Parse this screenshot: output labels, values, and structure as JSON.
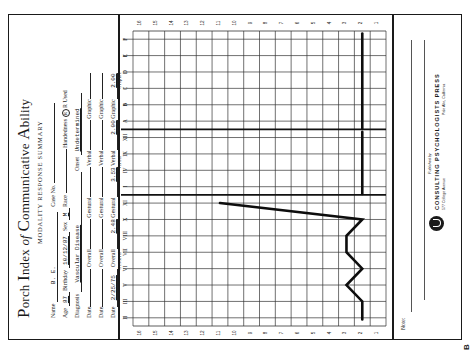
{
  "form": {
    "title_parts": [
      {
        "cap": "P",
        "rest": "orch "
      },
      {
        "cap": "I",
        "rest": "ndex "
      },
      {
        "cap": "",
        "rest": "of "
      },
      {
        "cap": "C",
        "rest": "ommunicative "
      },
      {
        "cap": "A",
        "rest": "bility"
      }
    ],
    "title": "Porch Index of Communicative Ability",
    "subtitle": "MODALITY RESPONSE SUMMARY",
    "fields": {
      "name_label": "Name",
      "name_value": "B. E.",
      "case_no_label": "Case No.",
      "case_no_value": "",
      "age_label": "Age",
      "age_value": "87",
      "birthday_label": "Birthday",
      "birthday_value": "10/12/87",
      "sex_label": "Sex",
      "sex_value": "M",
      "race_label": "Race",
      "race_value": "",
      "handedness_label": "Handedness",
      "handedness_value": "R",
      "hand_used_label": "R Used",
      "diagnosis_label": "Diagnosis",
      "diagnosis_value": "Vascular Disease",
      "onset_label": "Onset",
      "onset_value": "Undetermined"
    },
    "date_rows": [
      {
        "date_label": "Date",
        "date": "",
        "overall_label": "Overall",
        "overall": "",
        "gestural_label": "Gestural",
        "gestural": "",
        "verbal_label": "Verbal",
        "verbal": "",
        "graphic_label": "Graphic",
        "graphic": ""
      },
      {
        "date_label": "Date",
        "date": "",
        "overall_label": "Overall",
        "overall": "",
        "gestural_label": "Gestural",
        "gestural": "",
        "verbal_label": "Verbal",
        "verbal": "",
        "graphic_label": "Graphic",
        "graphic": ""
      },
      {
        "date_label": "Date",
        "date": "2/25/75",
        "overall_label": "Overall",
        "overall": "2.48",
        "gestural_label": "Gestural",
        "gestural": "3.53",
        "verbal_label": "Verbal",
        "verbal": "2.00",
        "graphic_label": "Graphic",
        "graphic": "2.00"
      }
    ]
  },
  "chart_data": {
    "type": "line",
    "title": "Modality Response Summary",
    "score_axis": {
      "label": "Score",
      "ticks": [
        16,
        15,
        14,
        13,
        12,
        11,
        10,
        9,
        8,
        7,
        6,
        5,
        4,
        3,
        2,
        1
      ],
      "range": [
        1,
        16
      ]
    },
    "sections": [
      {
        "name": "Gestural",
        "subtests": [
          "II",
          "III",
          "V",
          "VI",
          "VII",
          "VIII",
          "X",
          "XI"
        ]
      },
      {
        "name": "Verbal",
        "subtests": [
          "I",
          "IV",
          "IX",
          "XII"
        ]
      },
      {
        "name": "Graphic",
        "subtests": [
          "A",
          "B",
          "C",
          "D",
          "E",
          "F"
        ]
      }
    ],
    "series": [
      {
        "name": "Gestural",
        "x": [
          "II",
          "III",
          "V",
          "VI",
          "VII",
          "VIII",
          "X",
          "XI"
        ],
        "values": [
          2,
          2,
          3,
          2,
          3,
          3,
          2,
          11
        ]
      },
      {
        "name": "Verbal",
        "x": [
          "I",
          "IV",
          "IX",
          "XII"
        ],
        "values": [
          2,
          2,
          2,
          2
        ]
      },
      {
        "name": "Graphic",
        "x": [
          "A",
          "B",
          "C",
          "D",
          "E",
          "F"
        ],
        "values": [
          2,
          2,
          2,
          2,
          2,
          2
        ]
      }
    ],
    "grid": true
  },
  "footer": {
    "notes_label": "Note:",
    "published_by": "Published by",
    "publisher_line1": "CONSULTING  PSYCHOLOGISTS  PRESS",
    "address": "577 College Avenue",
    "city": "Palo Alto, California",
    "corner_mark": "B"
  }
}
